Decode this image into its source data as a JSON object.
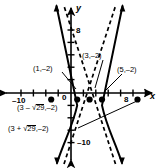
{
  "figure": {
    "kind": "hyperbola-graph"
  },
  "axes": {
    "x_label": "x",
    "y_label": "y",
    "origin_label": "0",
    "x_ticks": [
      {
        "value": -10,
        "label": "–10"
      },
      {
        "value": 8,
        "label": "8"
      }
    ],
    "y_ticks": [
      {
        "value": 8,
        "label": "8"
      },
      {
        "value": -10,
        "label": "–10"
      }
    ],
    "x_range": [
      -12,
      12
    ],
    "y_range": [
      -12,
      12
    ],
    "grid": false,
    "tick_spacing": 2,
    "arrowheads": true
  },
  "annotations": [
    {
      "id": "pt-1-neg2",
      "text": "(1,–2)",
      "point": [
        1,
        -2
      ],
      "has_leader": true
    },
    {
      "id": "pt-3-neg2",
      "text": "(3,–2)",
      "point": [
        3,
        -2
      ],
      "has_leader": true
    },
    {
      "id": "pt-5-neg2",
      "text": "(5,–2)",
      "point": [
        5,
        -2
      ],
      "has_leader": true
    },
    {
      "id": "pt-3-minus-r29",
      "text_parts": [
        "(3 – ",
        "29",
        ",–2)"
      ],
      "plain": "(3 – √29,–2)",
      "point": [
        -2.385,
        -2
      ],
      "has_leader": false
    },
    {
      "id": "pt-3-plus-r29",
      "text_parts": [
        "(3 + ",
        "29",
        ",–2)"
      ],
      "plain": "(3 + √29,–2)",
      "point": [
        8.385,
        -2
      ],
      "has_leader": true
    }
  ],
  "radical_symbol": "√",
  "radicand": "29",
  "marked_points": [
    {
      "x": -2.385,
      "y": -2,
      "filled": true,
      "name": "left-focus-dot"
    },
    {
      "x": 1,
      "y": -2,
      "filled": true,
      "name": "left-vertex-dot"
    },
    {
      "x": 3,
      "y": -2,
      "filled": true,
      "name": "center-dot"
    },
    {
      "x": 5,
      "y": -2,
      "filled": true,
      "name": "right-vertex-dot"
    },
    {
      "x": 8.385,
      "y": -2,
      "filled": true,
      "name": "right-focus-dot"
    }
  ],
  "curve": {
    "center": [
      3,
      -2
    ],
    "a": 2,
    "b": 5,
    "orientation": "horizontal",
    "style": "solid",
    "color": "#000000"
  },
  "asymptotes": {
    "style": "dashed",
    "color": "#000000",
    "slopes": [
      2.5,
      -2.5
    ],
    "through": [
      3,
      -2
    ]
  },
  "colors": {
    "background": "#ffffff",
    "ink": "#000000"
  }
}
